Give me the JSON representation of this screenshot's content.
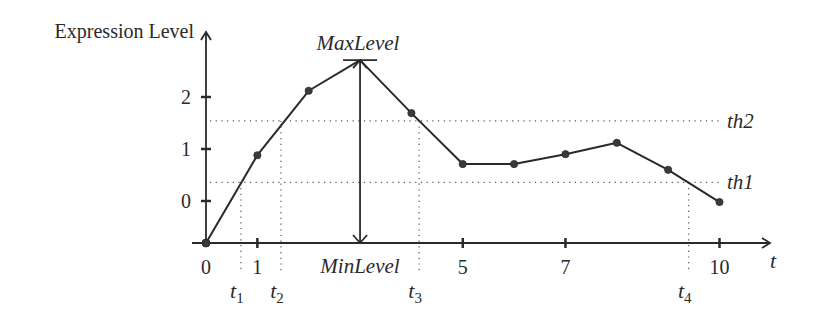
{
  "chart_data": {
    "type": "line",
    "title": "",
    "ylabel": "Expression Level",
    "xlabel": "t",
    "x": [
      0,
      1,
      2,
      3,
      4,
      5,
      6,
      7,
      8,
      9,
      10
    ],
    "series": [
      {
        "name": "expression",
        "values": [
          -0.81,
          0.88,
          2.12,
          2.71,
          1.69,
          0.71,
          0.71,
          0.9,
          1.12,
          0.6,
          -0.02
        ]
      }
    ],
    "x_ticks": [
      {
        "value": 0,
        "label": "0"
      },
      {
        "value": 1,
        "label": "1"
      },
      {
        "value": 5,
        "label": "5"
      },
      {
        "value": 7,
        "label": "7"
      },
      {
        "value": 10,
        "label": "10"
      }
    ],
    "y_ticks": [
      {
        "value": 0,
        "label": "0"
      },
      {
        "value": 1,
        "label": "1"
      },
      {
        "value": 2,
        "label": "2"
      }
    ],
    "thresholds": [
      {
        "name": "th1",
        "label": "th1",
        "value": 0.36
      },
      {
        "name": "th2",
        "label": "th2",
        "value": 1.54
      }
    ],
    "crossing_markers": [
      {
        "name": "t1",
        "label": "t",
        "sub": "1",
        "x": 0.68
      },
      {
        "name": "t2",
        "label": "t",
        "sub": "2",
        "x": 1.46
      },
      {
        "name": "t3",
        "label": "t",
        "sub": "3",
        "x": 4.15
      },
      {
        "name": "t4",
        "label": "t",
        "sub": "4",
        "x": 9.4
      }
    ],
    "annotations": {
      "max_label": "MaxLevel",
      "min_label": "MinLevel",
      "max_x": 3,
      "max_value": 2.71
    },
    "xlim": [
      0,
      11
    ],
    "ylim": [
      -0.81,
      3.25
    ],
    "grid": false,
    "legend": "none"
  }
}
